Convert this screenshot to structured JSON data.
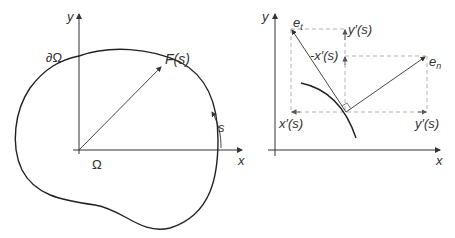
{
  "left_panel": {
    "axis_x_label": "x",
    "axis_y_label": "y",
    "boundary_label": "∂Ω",
    "domain_label": "Ω",
    "vector_label": "F(s)",
    "arc_label": "s"
  },
  "right_panel": {
    "axis_x_label": "x",
    "axis_y_label": "y",
    "tangent_label_base": "e",
    "tangent_label_sub": "t",
    "normal_label_base": "e",
    "normal_label_sub": "n",
    "neg_xprime_label": "-x′(s)",
    "yprime_top_label": "y′(s)",
    "xprime_bottom_label": "x′(s)",
    "yprime_bottom_label": "y′(s)"
  },
  "colors": {
    "stroke": "#333333",
    "dashed": "#aaaaaa"
  }
}
